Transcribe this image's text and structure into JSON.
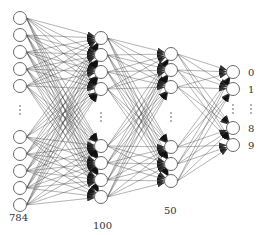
{
  "diagram": {
    "type": "fully-connected-neural-network",
    "colors": {
      "node_stroke": "#6a6a6a",
      "edge": "#3a3a3a",
      "arrowhead": "#111111",
      "text": "#333333"
    },
    "layers": [
      {
        "name": "input",
        "size_label": "784",
        "x": 20,
        "nodes_top": [
          18,
          35,
          52,
          69,
          86
        ],
        "nodes_bottom": [
          137,
          154,
          171,
          188,
          205
        ],
        "ellipsis_y": 110,
        "label_pos": [
          9,
          221
        ]
      },
      {
        "name": "hidden-1",
        "size_label": "100",
        "x": 101,
        "nodes_top": [
          38,
          55,
          72,
          89
        ],
        "nodes_bottom": [
          146,
          163,
          180,
          197
        ],
        "ellipsis_y": 117,
        "label_pos": [
          93,
          229
        ]
      },
      {
        "name": "hidden-2",
        "size_label": "50",
        "x": 171,
        "nodes_top": [
          54,
          70,
          87
        ],
        "nodes_bottom": [
          147,
          164,
          181
        ],
        "ellipsis_y": 117,
        "label_pos": [
          164,
          214
        ]
      },
      {
        "name": "output",
        "size_label": "",
        "x": 233,
        "nodes_top": [
          72,
          89
        ],
        "nodes_bottom": [
          128,
          145
        ],
        "ellipsis_y": 109,
        "output_labels": [
          "0",
          "1",
          "8",
          "9"
        ],
        "output_label_x": 248
      }
    ],
    "node_radius": 6.5
  }
}
